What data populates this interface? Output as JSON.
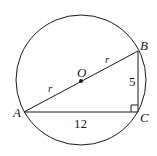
{
  "diagram": {
    "type": "geometry",
    "circle": {
      "center_label": "O",
      "cx": 81,
      "cy": 80,
      "r": 65
    },
    "points": {
      "A": {
        "label": "A",
        "x": 24,
        "y": 112
      },
      "B": {
        "label": "B",
        "x": 138,
        "y": 51
      },
      "C": {
        "label": "C",
        "x": 138,
        "y": 112
      },
      "O": {
        "label": "O",
        "x": 81,
        "y": 81
      }
    },
    "segments": {
      "AO": {
        "label": "r"
      },
      "OB": {
        "label": "r"
      },
      "BC": {
        "label": "5"
      },
      "AC": {
        "label": "12"
      }
    },
    "right_angle_at": "C",
    "colors": {
      "stroke": "#1a1a1a",
      "background": "#ffffff"
    }
  }
}
